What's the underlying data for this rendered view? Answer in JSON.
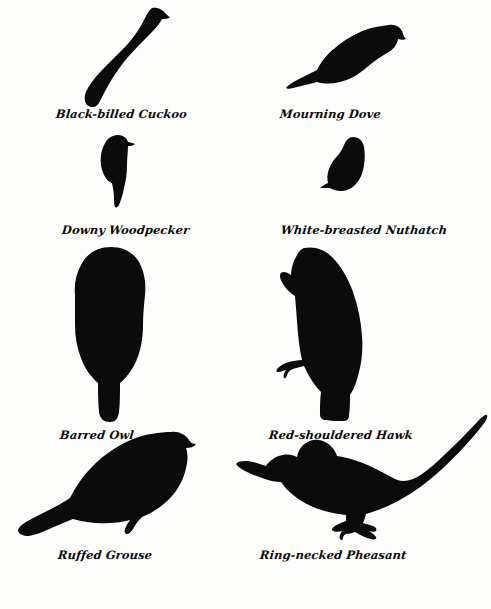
{
  "page": {
    "background_color": "#fdfdfc",
    "ink_color": "#0a0a0a",
    "width": 491,
    "height": 609
  },
  "birds": [
    {
      "id": "cuckoo",
      "label": "Black-billed Cuckoo",
      "icon": "bird-silhouette-perched-long-tail",
      "row": 1,
      "column": 1
    },
    {
      "id": "dove",
      "label": "Mourning Dove",
      "icon": "bird-silhouette-plump-pointed-tail",
      "row": 1,
      "column": 2
    },
    {
      "id": "downy",
      "label": "Downy Woodpecker",
      "icon": "bird-silhouette-clinging-woodpecker",
      "row": 2,
      "column": 1
    },
    {
      "id": "nuthatch",
      "label": "White-breasted Nuthatch",
      "icon": "bird-silhouette-stubby-nuthatch",
      "row": 2,
      "column": 2
    },
    {
      "id": "owl",
      "label": "Barred Owl",
      "icon": "bird-silhouette-upright-owl",
      "row": 3,
      "column": 1
    },
    {
      "id": "hawk",
      "label": "Red-shouldered Hawk",
      "icon": "bird-silhouette-perched-hawk",
      "row": 3,
      "column": 2
    },
    {
      "id": "grouse",
      "label": "Ruffed Grouse",
      "icon": "bird-silhouette-ground-grouse",
      "row": 4,
      "column": 1
    },
    {
      "id": "pheasant",
      "label": "Ring-necked Pheasant",
      "icon": "bird-silhouette-long-tailed-pheasant",
      "row": 4,
      "column": 2
    }
  ]
}
